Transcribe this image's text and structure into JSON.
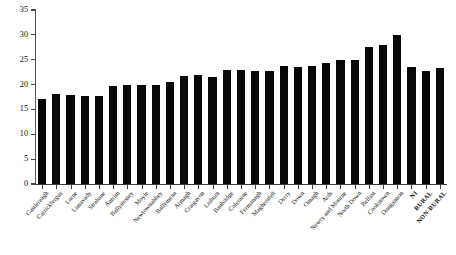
{
  "chart_data": {
    "type": "bar",
    "title": "",
    "subtitle": "",
    "xlabel": "",
    "ylabel": "",
    "ylim": [
      0,
      35
    ],
    "ytick_step": 5,
    "yticks": [
      0,
      5,
      10,
      15,
      20,
      25,
      30,
      35
    ],
    "ytick_labels": [
      "0",
      "5",
      "10",
      "15",
      "20",
      "25",
      "30",
      "35"
    ],
    "grid": false,
    "legend": null,
    "bar_color": "#080808",
    "axis_color": "#4a4a4a",
    "categories": [
      "Castlereagh",
      "Carrickfergus",
      "Larne",
      "Limavady",
      "Strabane",
      "Antrim",
      "Ballymoney",
      "Moyle",
      "Newtownabbey",
      "Ballymena",
      "Armagh",
      "Craigavon",
      "Lisburn",
      "Banbridge",
      "Coleraine",
      "Fermanagh",
      "Magherafelt",
      "Derry",
      "Down",
      "Omagh",
      "Ards",
      "Newry and Mourne",
      "North Down",
      "Belfast",
      "Cookstown",
      "Dungannon",
      "NI",
      "RURAL",
      "NON-RURAL"
    ],
    "values": [
      17.0,
      18.2,
      18.0,
      17.8,
      17.7,
      19.8,
      20.0,
      20.0,
      20.0,
      20.6,
      21.8,
      21.9,
      21.6,
      23.0,
      23.0,
      22.7,
      22.7,
      23.8,
      23.6,
      23.8,
      24.3,
      25.0,
      25.0,
      27.5,
      28.0,
      30.0,
      23.5,
      22.8,
      23.3
    ],
    "emphasis_categories": [
      "NI",
      "RURAL",
      "NON-RURAL"
    ]
  },
  "caption": {
    "text": ""
  }
}
